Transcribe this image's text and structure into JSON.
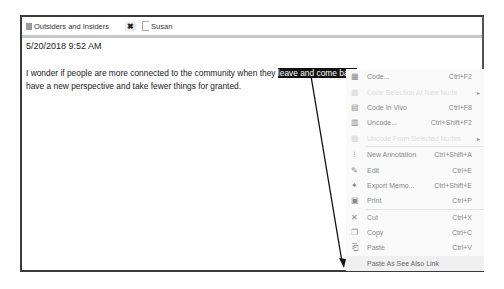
{
  "tabs": [
    {
      "label": "Outsiders and Insiders",
      "icon": "document-icon"
    },
    {
      "label": "Susan",
      "icon": "page-icon"
    }
  ],
  "close_glyph": "✖",
  "memo": {
    "timestamp": "5/20/2018 9:52 AM",
    "text_before": "I wonder if people  are more connected to the community when they ",
    "selected_text": "leave and come back",
    "text_after": ", because they have a new perspective and take fewer things for granted."
  },
  "context_menu": {
    "items": [
      {
        "label": "Code...",
        "shortcut": "Ctrl+F2",
        "icon": "code-icon",
        "glyph": "▦",
        "disabled": false
      },
      {
        "label": "Code Selection At New Node",
        "shortcut": "",
        "icon": "code-new-icon",
        "glyph": "▦",
        "disabled": true,
        "submenu": true
      },
      {
        "label": "Code In Vivo",
        "shortcut": "Ctrl+F8",
        "icon": "code-in-vivo-icon",
        "glyph": "▤",
        "disabled": false
      },
      {
        "label": "Uncode...",
        "shortcut": "Ctrl+Shift+F2",
        "icon": "uncode-icon",
        "glyph": "▥",
        "disabled": false
      },
      {
        "label": "Uncode From Selected Nodes",
        "shortcut": "",
        "icon": "uncode-selected-icon",
        "glyph": "▦",
        "disabled": true,
        "submenu": true
      },
      {
        "label": "New Annotation",
        "shortcut": "Ctrl+Shift+A",
        "icon": "annotation-icon",
        "glyph": "⁝",
        "disabled": false
      },
      {
        "label": "Edit",
        "shortcut": "Ctrl+E",
        "icon": "pencil-icon",
        "glyph": "✎",
        "disabled": false
      },
      {
        "label": "Export Memo...",
        "shortcut": "Ctrl+Shift+E",
        "icon": "export-icon",
        "glyph": "✦",
        "disabled": false
      },
      {
        "label": "Print",
        "shortcut": "Ctrl+P",
        "icon": "printer-icon",
        "glyph": "▣",
        "disabled": false
      },
      {
        "label": "Cut",
        "shortcut": "Ctrl+X",
        "icon": "scissors-icon",
        "glyph": "✕",
        "disabled": false
      },
      {
        "label": "Copy",
        "shortcut": "Ctrl+C",
        "icon": "copy-icon",
        "glyph": "❐",
        "disabled": false
      },
      {
        "label": "Paste",
        "shortcut": "Ctrl+V",
        "icon": "clipboard-icon",
        "glyph": "⎗",
        "disabled": false
      },
      {
        "label": "Paste As See Also Link",
        "shortcut": "",
        "icon": "link-icon",
        "glyph": "",
        "disabled": false,
        "highlighted": true
      }
    ]
  }
}
